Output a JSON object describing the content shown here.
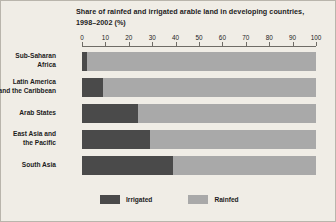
{
  "chart_data": {
    "type": "bar",
    "orientation": "horizontal",
    "stacked": true,
    "title": "Share of rainfed and irrigated arable land in developing countries, 1998–2002 (%)",
    "title_line1": "Share of rainfed and irrigated arable land in developing countries,",
    "title_line2": "1998–2002 (%)",
    "xlabel": "",
    "ylabel": "",
    "xlim": [
      0,
      100
    ],
    "grid": false,
    "axis_position": "top",
    "legend_position": "bottom",
    "categories": [
      "Sub-Saharan Africa",
      "Latin America and the Caribbean",
      "Arab States",
      "East Asia and the Pacific",
      "South Asia"
    ],
    "category_lines": [
      [
        "Sub-Saharan",
        "Africa"
      ],
      [
        "Latin America",
        "and  the Caribbean"
      ],
      [
        "Arab States"
      ],
      [
        "East Asia and",
        "the Pacific"
      ],
      [
        "South Asia"
      ]
    ],
    "tick_labels": [
      "0",
      "10",
      "20",
      "30",
      "40",
      "50",
      "60",
      "70",
      "80",
      "90",
      "100"
    ],
    "tick_values": [
      0,
      10,
      20,
      30,
      40,
      50,
      60,
      70,
      80,
      90,
      100
    ],
    "series": [
      {
        "name": "Irrigated",
        "color": "#4a4a4a",
        "values": [
          2,
          9,
          24,
          29,
          39
        ]
      },
      {
        "name": "Rainfed",
        "color": "#a9a9a9",
        "values": [
          98,
          91,
          76,
          71,
          61
        ]
      }
    ]
  },
  "colors": {
    "background": "#f0ede6",
    "border": "#b9b5ac",
    "axis": "#6f6c66",
    "text": "#1c1c1c",
    "irrigated": "#4a4a4a",
    "rainfed": "#a9a9a9"
  }
}
